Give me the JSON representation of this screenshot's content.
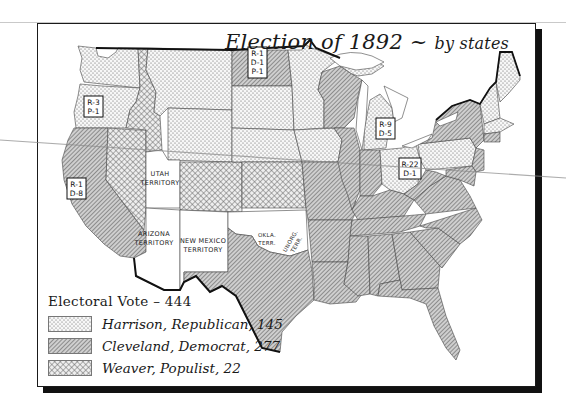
{
  "map": {
    "title": "Election of 1892",
    "subtitle": "by states",
    "title_separator": "~",
    "legend": {
      "title": "Electoral Vote – 444",
      "total_electoral_votes": 444,
      "entries": [
        {
          "candidate": "Harrison",
          "party": "Republican",
          "votes": 145,
          "label": "Harrison, Republican, 145",
          "pattern": "dots",
          "color": "#f2f2f2"
        },
        {
          "candidate": "Cleveland",
          "party": "Democrat",
          "votes": 277,
          "label": "Cleveland, Democrat, 277",
          "pattern": "diagonal-hatch",
          "color": "#b8b8b8"
        },
        {
          "candidate": "Weaver",
          "party": "Populist",
          "votes": 22,
          "label": "Weaver, Populist, 22",
          "pattern": "crosshatch",
          "color": "#d4d4d4"
        }
      ]
    },
    "split_state_labels": [
      {
        "state": "Oregon",
        "lines": [
          "R-3",
          "P-1"
        ]
      },
      {
        "state": "California",
        "lines": [
          "R-1",
          "D-8"
        ]
      },
      {
        "state": "North Dakota",
        "lines": [
          "R-1",
          "D-1",
          "P-1"
        ]
      },
      {
        "state": "Michigan",
        "lines": [
          "R-9",
          "D-5"
        ]
      },
      {
        "state": "Ohio",
        "lines": [
          "R-22",
          "D-1"
        ]
      }
    ],
    "territory_labels": [
      {
        "name": "utah",
        "lines": [
          "UTAH",
          "TERRITORY"
        ]
      },
      {
        "name": "arizona",
        "lines": [
          "ARIZONA",
          "TERRITORY"
        ]
      },
      {
        "name": "new-mexico",
        "lines": [
          "NEW MEXICO",
          "TERRITORY"
        ]
      },
      {
        "name": "oklahoma",
        "lines": [
          "OKLA.",
          "TERR."
        ]
      },
      {
        "name": "unorganized",
        "lines": [
          "UNORG.",
          "TERR."
        ]
      }
    ]
  }
}
